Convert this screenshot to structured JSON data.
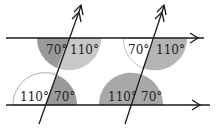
{
  "diagram": {
    "colors": {
      "dark_fill": "#9a9a9a",
      "light_fill": "#c8c8c8",
      "white_fill": "#ffffff",
      "line": "#1a1a1a"
    },
    "angles": {
      "top_left_acute": "70°",
      "top_left_obtuse": "110°",
      "top_right_acute": "70°",
      "top_right_obtuse": "110°",
      "bottom_left_obtuse": "110°",
      "bottom_left_acute": "70°",
      "bottom_right_obtuse": "110°",
      "bottom_right_acute": "70°"
    }
  }
}
